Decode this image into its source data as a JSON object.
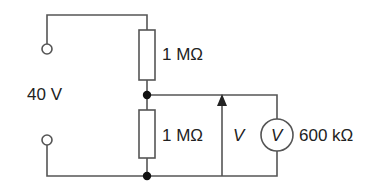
{
  "diagram": {
    "type": "circuit",
    "colors": {
      "wire": "#555555",
      "text": "#222222",
      "background": "#ffffff"
    },
    "supply": {
      "label": "40 V"
    },
    "resistors": [
      {
        "id": "R1",
        "position": "upper",
        "label": "1 MΩ"
      },
      {
        "id": "R2",
        "position": "lower",
        "label": "1 MΩ"
      }
    ],
    "voltage_arrow": {
      "label": "V"
    },
    "voltmeter": {
      "symbol": "V",
      "label": "600 kΩ"
    }
  }
}
